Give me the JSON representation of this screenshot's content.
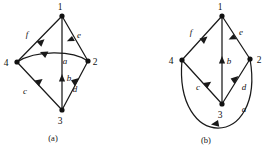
{
  "figure": {
    "background_color": "#ffffff",
    "ink_color": "#1a1a1a",
    "panels": [
      {
        "id": "panel-a",
        "caption": "(a)",
        "caption_pos": {
          "x": 53,
          "y": 140
        },
        "vertices": [
          {
            "id": "1",
            "label": "1",
            "x": 62,
            "y": 16,
            "label_x": 60,
            "label_y": 10
          },
          {
            "id": "4",
            "label": "4",
            "x": 17,
            "y": 62,
            "label_x": 6,
            "label_y": 66
          },
          {
            "id": "2",
            "label": "2",
            "x": 88,
            "y": 61,
            "label_x": 94,
            "label_y": 65
          },
          {
            "id": "3",
            "label": "3",
            "x": 62,
            "y": 110,
            "label_x": 59,
            "label_y": 123
          }
        ],
        "edges": [
          {
            "id": "f",
            "label": "f",
            "from": "1",
            "to": "4",
            "shape": "straight",
            "label_x": 27,
            "label_y": 36
          },
          {
            "id": "e",
            "label": "e",
            "from": "1",
            "to": "2",
            "shape": "straight",
            "label_x": 78,
            "label_y": 37
          },
          {
            "id": "b",
            "label": "b",
            "from": "3",
            "to": "1",
            "shape": "straight",
            "label_x": 67,
            "label_y": 79
          },
          {
            "id": "c",
            "label": "c",
            "from": "3",
            "to": "4",
            "shape": "straight",
            "label_x": 25,
            "label_y": 92
          },
          {
            "id": "d",
            "label": "d",
            "from": "3",
            "to": "2",
            "shape": "straight",
            "label_x": 74,
            "label_y": 90
          },
          {
            "id": "a",
            "label": "a",
            "from": "2",
            "to": "4",
            "shape": "arc-up",
            "label_x": 64,
            "label_y": 62
          }
        ]
      },
      {
        "id": "panel-b",
        "caption": "(b)",
        "caption_pos": {
          "x": 205,
          "y": 142
        },
        "vertices": [
          {
            "id": "1",
            "label": "1",
            "x": 222,
            "y": 16,
            "label_x": 220,
            "label_y": 10
          },
          {
            "id": "4",
            "label": "4",
            "x": 182,
            "y": 60,
            "label_x": 171,
            "label_y": 64
          },
          {
            "id": "2",
            "label": "2",
            "x": 250,
            "y": 59,
            "label_x": 256,
            "label_y": 63
          },
          {
            "id": "3",
            "label": "3",
            "x": 222,
            "y": 104,
            "label_x": 219,
            "label_y": 117
          }
        ],
        "edges": [
          {
            "id": "f",
            "label": "f",
            "from": "1",
            "to": "4",
            "shape": "straight",
            "label_x": 191,
            "label_y": 34
          },
          {
            "id": "e",
            "label": "e",
            "from": "1",
            "to": "2",
            "shape": "straight",
            "label_x": 240,
            "label_y": 34
          },
          {
            "id": "b",
            "label": "b",
            "from": "3",
            "to": "1",
            "shape": "straight",
            "label_x": 227,
            "label_y": 62
          },
          {
            "id": "c",
            "label": "c",
            "from": "3",
            "to": "4",
            "shape": "straight",
            "label_x": 198,
            "label_y": 88
          },
          {
            "id": "d",
            "label": "d",
            "from": "3",
            "to": "2",
            "shape": "straight",
            "label_x": 243,
            "label_y": 88
          },
          {
            "id": "a",
            "label": "a",
            "from": "2",
            "to": "4",
            "shape": "arc-bottom",
            "label_x": 243,
            "label_y": 110
          }
        ]
      }
    ]
  }
}
